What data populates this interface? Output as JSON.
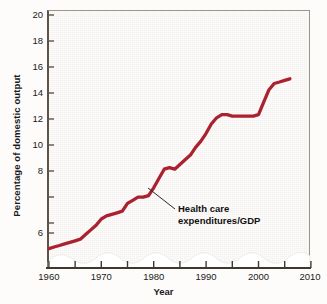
{
  "chart_data": {
    "type": "line",
    "title": "",
    "xlabel": "Year",
    "ylabel": "Percentage of domestic output",
    "xlim": [
      1960,
      2010
    ],
    "ylim": [
      4.4,
      20
    ],
    "y_axis_break": true,
    "grid": false,
    "legend": "none",
    "annotation": {
      "line1": "Health care",
      "line2": "expenditures/GDP",
      "points_to_year": 1980,
      "points_to_value": 8.9
    },
    "x_ticks_major": [
      "1960",
      "1970",
      "1980",
      "1990",
      "2000",
      "2010"
    ],
    "x_ticks_minor": [
      "1965",
      "1975",
      "1985",
      "1995",
      "2005"
    ],
    "y_ticks": [
      "6",
      "8",
      "10",
      "12",
      "14",
      "16",
      "18",
      "20"
    ],
    "series": [
      {
        "name": "Health care expenditures/GDP",
        "color": "#ab2130",
        "x": [
          1960,
          1961,
          1962,
          1963,
          1964,
          1965,
          1966,
          1967,
          1968,
          1969,
          1970,
          1971,
          1972,
          1973,
          1974,
          1975,
          1976,
          1977,
          1978,
          1979,
          1980,
          1981,
          1982,
          1983,
          1984,
          1985,
          1986,
          1987,
          1988,
          1989,
          1990,
          1991,
          1992,
          1993,
          1994,
          1995,
          1996,
          1997,
          1998,
          1999,
          2000,
          2001,
          2002,
          2003,
          2004,
          2005,
          2006
        ],
        "values": [
          5.0,
          5.1,
          5.2,
          5.3,
          5.4,
          5.5,
          5.6,
          5.9,
          6.2,
          6.5,
          6.9,
          7.1,
          7.2,
          7.3,
          7.4,
          7.9,
          8.1,
          8.3,
          8.3,
          8.4,
          8.9,
          9.5,
          10.1,
          10.2,
          10.1,
          10.4,
          10.7,
          11.0,
          11.5,
          11.9,
          12.4,
          13.0,
          13.4,
          13.6,
          13.6,
          13.5,
          13.5,
          13.5,
          13.5,
          13.5,
          13.6,
          14.4,
          15.2,
          15.6,
          15.7,
          15.8,
          15.9
        ]
      }
    ]
  },
  "figure": {
    "background_color": "#fdfcfa",
    "panel_color": "#dcbb9e",
    "axis_color": "#5d5347",
    "line_color": "#ab2130",
    "break_color": "#ffffff"
  }
}
